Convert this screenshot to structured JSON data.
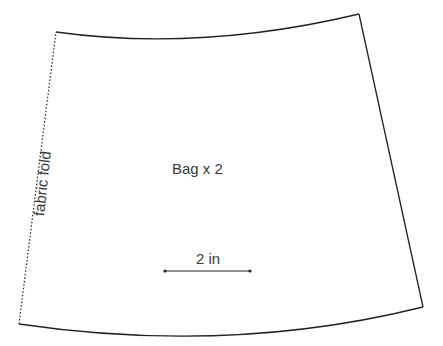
{
  "pattern": {
    "piece_label": "Bag x 2",
    "fold_label": "fabric fold",
    "scale_label": "2 in",
    "line_color": "#222222",
    "text_color": "#3a3a3a"
  }
}
